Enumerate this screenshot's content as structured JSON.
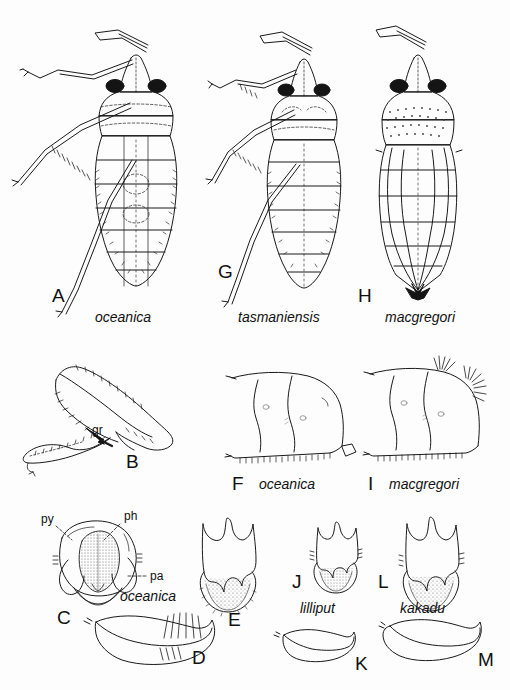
{
  "plate": {
    "kind": "scientific-illustration-plate",
    "subject": "dorsal habitus, legs and genitalia of bug species",
    "background_color": "#fdfdfd",
    "ink_color": "#1a1a1a"
  },
  "panels": [
    {
      "id": "A",
      "letter": "A",
      "species": "oceanica",
      "type": "dorsal-habitus",
      "letter_pos": {
        "x": 52,
        "y": 286
      },
      "species_pos": {
        "x": 95,
        "y": 310
      }
    },
    {
      "id": "G",
      "letter": "G",
      "species": "tasmaniensis",
      "type": "dorsal-habitus",
      "letter_pos": {
        "x": 218,
        "y": 262
      },
      "species_pos": {
        "x": 238,
        "y": 310
      }
    },
    {
      "id": "H",
      "letter": "H",
      "species": "macgregori",
      "type": "dorsal-habitus",
      "letter_pos": {
        "x": 358,
        "y": 286
      },
      "species_pos": {
        "x": 385,
        "y": 310
      }
    },
    {
      "id": "B",
      "letter": "B",
      "species": "",
      "type": "hind-leg",
      "letter_pos": {
        "x": 126,
        "y": 452
      },
      "species_pos": null
    },
    {
      "id": "F",
      "letter": "F",
      "species": "oceanica",
      "type": "abdomen-lateral",
      "letter_pos": {
        "x": 232,
        "y": 486
      },
      "species_pos": {
        "x": 259,
        "y": 485
      }
    },
    {
      "id": "I",
      "letter": "I",
      "species": "macgregori",
      "type": "abdomen-lateral",
      "letter_pos": {
        "x": 366,
        "y": 486
      },
      "species_pos": {
        "x": 389,
        "y": 485
      }
    },
    {
      "id": "C",
      "letter": "C",
      "species": "oceanica",
      "type": "pygophore-dorsal",
      "letter_pos": {
        "x": 57,
        "y": 608
      },
      "species_pos": {
        "x": 120,
        "y": 596
      }
    },
    {
      "id": "E",
      "letter": "E",
      "species": "",
      "type": "genital-plate",
      "letter_pos": {
        "x": 228,
        "y": 610
      },
      "species_pos": null
    },
    {
      "id": "J",
      "letter": "J",
      "species": "lilliput",
      "type": "genital-plate",
      "letter_pos": {
        "x": 292,
        "y": 588
      },
      "species_pos": {
        "x": 300,
        "y": 611
      }
    },
    {
      "id": "L",
      "letter": "L",
      "species": "kakadu",
      "type": "genital-plate",
      "letter_pos": {
        "x": 378,
        "y": 588
      },
      "species_pos": {
        "x": 400,
        "y": 611
      }
    },
    {
      "id": "D",
      "letter": "D",
      "species": "",
      "type": "paramere",
      "letter_pos": {
        "x": 192,
        "y": 658
      },
      "species_pos": null
    },
    {
      "id": "K",
      "letter": "K",
      "species": "",
      "type": "paramere",
      "letter_pos": {
        "x": 355,
        "y": 664
      },
      "species_pos": null
    },
    {
      "id": "M",
      "letter": "M",
      "species": "",
      "type": "paramere",
      "letter_pos": {
        "x": 478,
        "y": 660
      },
      "species_pos": null
    }
  ],
  "anatomical_labels": [
    {
      "text": "gr",
      "panel": "B",
      "x": 92,
      "y": 432,
      "size": "normal"
    },
    {
      "text": "py",
      "panel": "C",
      "x": 43,
      "y": 521,
      "size": "normal"
    },
    {
      "text": "ph",
      "panel": "C",
      "x": 125,
      "y": 518,
      "size": "normal"
    },
    {
      "text": "pa",
      "panel": "C",
      "x": 150,
      "y": 578,
      "size": "normal"
    }
  ]
}
